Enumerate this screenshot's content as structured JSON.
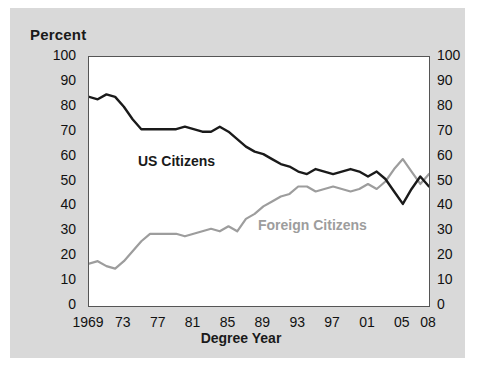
{
  "figure": {
    "axis_title_y": "Percent",
    "axis_title_x": "Degree Year",
    "background_color": "#d9d9d9",
    "plot_background_color": "#ffffff"
  },
  "labels": {
    "us": "US Citizens",
    "foreign": "Foreign Citizens"
  },
  "chart_data": {
    "type": "line",
    "title": "",
    "subtitle": "",
    "xlabel": "Degree Year",
    "ylabel": "Percent",
    "ylim": [
      0,
      100
    ],
    "xlim": [
      1969,
      2008
    ],
    "yticks": [
      0,
      10,
      20,
      30,
      40,
      50,
      60,
      70,
      80,
      90,
      100
    ],
    "ytick_labels_left": [
      "0",
      "10",
      "20",
      "30",
      "40",
      "50",
      "60",
      "70",
      "80",
      "90",
      "100"
    ],
    "ytick_labels_right": [
      "0",
      "10",
      "20",
      "30",
      "40",
      "50",
      "60",
      "70",
      "80",
      "90",
      "100"
    ],
    "xticks": [
      1969,
      1973,
      1977,
      1981,
      1985,
      1989,
      1993,
      1997,
      2001,
      2005,
      2008
    ],
    "xtick_labels": [
      "1969",
      "73",
      "77",
      "81",
      "85",
      "89",
      "93",
      "97",
      "01",
      "05",
      "08"
    ],
    "grid": false,
    "legend_position": "inline-annotation",
    "x": [
      1969,
      1970,
      1971,
      1972,
      1973,
      1974,
      1975,
      1976,
      1977,
      1978,
      1979,
      1980,
      1981,
      1982,
      1983,
      1984,
      1985,
      1986,
      1987,
      1988,
      1989,
      1990,
      1991,
      1992,
      1993,
      1994,
      1995,
      1996,
      1997,
      1998,
      1999,
      2000,
      2001,
      2002,
      2003,
      2004,
      2005,
      2006,
      2007,
      2008
    ],
    "series": [
      {
        "name": "US Citizens",
        "color": "#1a1a1a",
        "values": [
          84,
          83,
          85,
          84,
          80,
          75,
          71,
          71,
          71,
          71,
          71,
          72,
          71,
          70,
          70,
          72,
          70,
          67,
          64,
          62,
          61,
          59,
          57,
          56,
          54,
          53,
          55,
          54,
          53,
          54,
          55,
          54,
          52,
          54,
          51,
          46,
          41,
          47,
          52,
          48
        ]
      },
      {
        "name": "Foreign Citizens",
        "color": "#9d9d9d",
        "values": [
          17,
          18,
          16,
          15,
          18,
          22,
          26,
          29,
          29,
          29,
          29,
          28,
          29,
          30,
          31,
          30,
          32,
          30,
          35,
          37,
          40,
          42,
          44,
          45,
          48,
          48,
          46,
          47,
          48,
          47,
          46,
          47,
          49,
          47,
          50,
          55,
          59,
          54,
          49,
          53
        ]
      }
    ]
  }
}
